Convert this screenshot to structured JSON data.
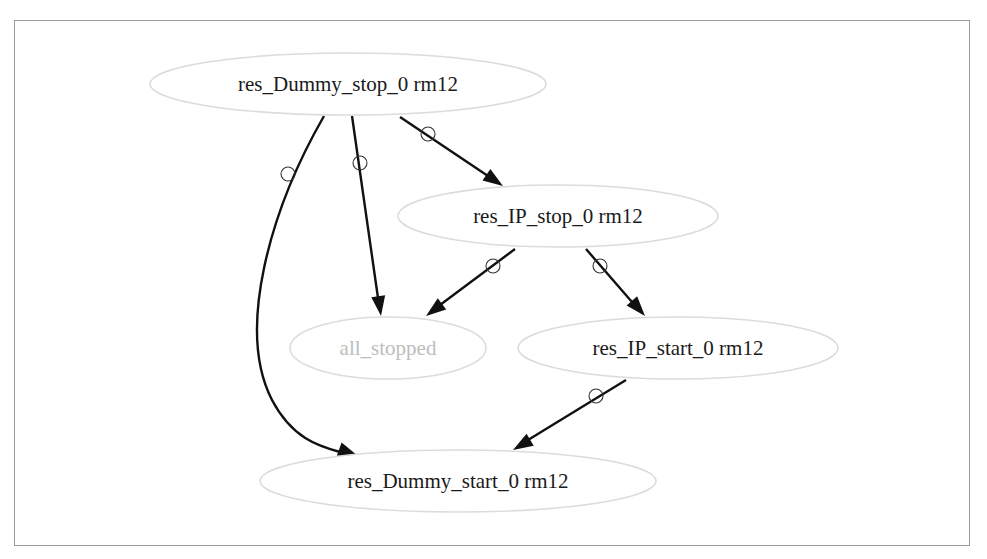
{
  "graph": {
    "nodes": [
      {
        "id": "dummy_stop",
        "label": "res_Dummy_stop_0 rm12",
        "cx": 348,
        "cy": 84,
        "rx": 198,
        "ry": 31,
        "muted": false
      },
      {
        "id": "ip_stop",
        "label": "res_IP_stop_0 rm12",
        "cx": 558,
        "cy": 216,
        "rx": 160,
        "ry": 31,
        "muted": false
      },
      {
        "id": "all_stopped",
        "label": "all_stopped",
        "cx": 388,
        "cy": 348,
        "rx": 98,
        "ry": 31,
        "muted": true
      },
      {
        "id": "ip_start",
        "label": "res_IP_start_0 rm12",
        "cx": 678,
        "cy": 348,
        "rx": 160,
        "ry": 31,
        "muted": false
      },
      {
        "id": "dummy_start",
        "label": "res_Dummy_start_0 rm12",
        "cx": 458,
        "cy": 481,
        "rx": 198,
        "ry": 31,
        "muted": false
      }
    ],
    "edges": [
      {
        "from": "dummy_stop",
        "to": "dummy_start",
        "path": "M324,116 C270,210 236,330 272,400 C292,438 318,446 340,452",
        "marker": [
          288,
          174
        ],
        "head": {
          "x": 358,
          "y": 456,
          "angle": 20
        }
      },
      {
        "from": "dummy_stop",
        "to": "all_stopped",
        "path": "M352,116 L378,298",
        "marker": [
          360,
          163
        ],
        "head": {
          "x": 381,
          "y": 316,
          "angle": 82
        }
      },
      {
        "from": "dummy_stop",
        "to": "ip_stop",
        "path": "M400,117 L488,176",
        "marker": [
          428,
          134
        ],
        "head": {
          "x": 503,
          "y": 186,
          "angle": 34
        }
      },
      {
        "from": "ip_stop",
        "to": "all_stopped",
        "path": "M515,249 L440,305",
        "marker": [
          493,
          266
        ],
        "head": {
          "x": 426,
          "y": 316,
          "angle": 143
        }
      },
      {
        "from": "ip_stop",
        "to": "ip_start",
        "path": "M586,249 L632,302",
        "marker": [
          600,
          266
        ],
        "head": {
          "x": 645,
          "y": 316,
          "angle": 49
        }
      },
      {
        "from": "ip_start",
        "to": "dummy_start",
        "path": "M626,380 L528,440",
        "marker": [
          596,
          396
        ],
        "head": {
          "x": 513,
          "y": 450,
          "angle": 149
        }
      }
    ]
  }
}
